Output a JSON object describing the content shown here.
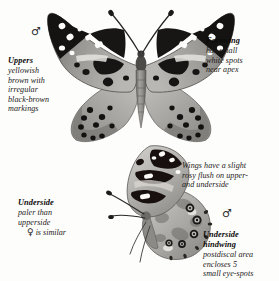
{
  "plate": {
    "subject": "painted-lady-butterfly",
    "background_color": "#fdfdfc",
    "text_color": "#1c1a18",
    "style": "grayscale field guide plate"
  },
  "symbols": {
    "male_upper": "♂",
    "male_lower": "♂",
    "female": "♀"
  },
  "notes": {
    "uppers": {
      "heading": "Uppers",
      "lines": [
        "yellowish",
        "brown with",
        "irregular",
        "black-brown",
        "markings"
      ]
    },
    "forewing": {
      "heading": "Forewing",
      "lines": [
        "has small",
        "white spots",
        "near apex"
      ]
    },
    "underside": {
      "heading": "Underside",
      "lines": [
        "paler than",
        "upperside"
      ]
    },
    "female_similar": {
      "symbol": "♀",
      "text": "is similar"
    },
    "wings_flush": {
      "heading": "",
      "lines": [
        "Wings have a slight",
        "rosy flush on upper-",
        "and underside"
      ]
    },
    "underside_hindwing": {
      "heading_line1": "Underside",
      "heading_line2": "hindwing",
      "lines": [
        "postdiscal area",
        "encloses 5",
        "small eye-spots"
      ]
    }
  },
  "specimens": {
    "upperside": {
      "name": "upperside-specimen",
      "view": "dorsal spread wings"
    },
    "underside": {
      "name": "underside-specimen",
      "view": "ventral lateral"
    }
  }
}
